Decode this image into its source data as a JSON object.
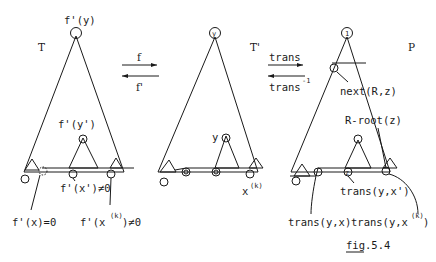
{
  "figure": {
    "caption": "fig.5.4",
    "caption_underlined": "fig",
    "caption_rest": ".5.4"
  },
  "trees": {
    "T": {
      "name": "T",
      "root_label": "f'(y)",
      "inner_label": "f'(y')",
      "labels": {
        "fx": "f'(x)=0",
        "fx1": "f'(x')≠0",
        "fxk_base": "f'(x",
        "fxk_sup": "(k)",
        "fxk_tail": ")≠0"
      }
    },
    "Tprime": {
      "name": "T'",
      "root_label": "y",
      "inner_label": "y",
      "leaf_label_base": "x",
      "leaf_label_sup": "(k)"
    },
    "P": {
      "name": "P",
      "root_label": "1",
      "next_label": "next(R,z)",
      "rroot_label": "R-root(z)",
      "z_label": "z",
      "trans_x1": "trans(y,x')",
      "trans_x": "trans(y,x)",
      "trans_xk_base": "trans(y,x",
      "trans_xk_sup": "(k)",
      "trans_xk_tail": ")"
    }
  },
  "arrows": {
    "f_forward": "f",
    "f_back": "f'",
    "trans_forward": "trans",
    "trans_back_base": "trans",
    "trans_back_sup": "-1"
  },
  "colors": {
    "ink": "#1a1a1a",
    "paper": "#ffffff"
  }
}
